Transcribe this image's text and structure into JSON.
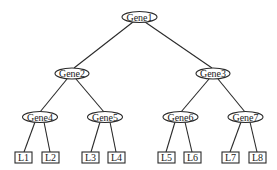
{
  "diagram": {
    "type": "binary-tree",
    "nodes": [
      {
        "id": "gene1",
        "label": "Gene1",
        "shape": "ellipse",
        "cx": 139.5,
        "cy": 17
      },
      {
        "id": "gene2",
        "label": "Gene2",
        "shape": "ellipse",
        "cx": 72,
        "cy": 73.5
      },
      {
        "id": "gene3",
        "label": "Gene3",
        "shape": "ellipse",
        "cx": 213,
        "cy": 73.5
      },
      {
        "id": "gene4",
        "label": "Gene4",
        "shape": "ellipse",
        "cx": 40,
        "cy": 117
      },
      {
        "id": "gene5",
        "label": "Gene5",
        "shape": "ellipse",
        "cx": 105,
        "cy": 117
      },
      {
        "id": "gene6",
        "label": "Gene6",
        "shape": "ellipse",
        "cx": 180.5,
        "cy": 117
      },
      {
        "id": "gene7",
        "label": "Gene7",
        "shape": "ellipse",
        "cx": 245.5,
        "cy": 117
      }
    ],
    "leaves": [
      {
        "id": "l1",
        "label": "L1",
        "shape": "rect",
        "x": 15,
        "y": 152
      },
      {
        "id": "l2",
        "label": "L2",
        "shape": "rect",
        "x": 42,
        "y": 152
      },
      {
        "id": "l3",
        "label": "L3",
        "shape": "rect",
        "x": 82,
        "y": 152
      },
      {
        "id": "l4",
        "label": "L4",
        "shape": "rect",
        "x": 108,
        "y": 152
      },
      {
        "id": "l5",
        "label": "L5",
        "shape": "rect",
        "x": 158,
        "y": 152
      },
      {
        "id": "l6",
        "label": "L6",
        "shape": "rect",
        "x": 184,
        "y": 152
      },
      {
        "id": "l7",
        "label": "L7",
        "shape": "rect",
        "x": 222,
        "y": 152
      },
      {
        "id": "l8",
        "label": "L8",
        "shape": "rect",
        "x": 249,
        "y": 152
      }
    ],
    "edges": [
      {
        "from": "Gene1",
        "to": "Gene2"
      },
      {
        "from": "Gene1",
        "to": "Gene3"
      },
      {
        "from": "Gene2",
        "to": "Gene4"
      },
      {
        "from": "Gene2",
        "to": "Gene5"
      },
      {
        "from": "Gene3",
        "to": "Gene6"
      },
      {
        "from": "Gene3",
        "to": "Gene7"
      },
      {
        "from": "Gene4",
        "to": "L1"
      },
      {
        "from": "Gene4",
        "to": "L2"
      },
      {
        "from": "Gene5",
        "to": "L3"
      },
      {
        "from": "Gene5",
        "to": "L4"
      },
      {
        "from": "Gene6",
        "to": "L5"
      },
      {
        "from": "Gene6",
        "to": "L6"
      },
      {
        "from": "Gene7",
        "to": "L7"
      },
      {
        "from": "Gene7",
        "to": "L8"
      }
    ],
    "colors": {
      "stroke": "#2a2a2a",
      "fill": "#ffffff",
      "text": "#1a1a1a"
    }
  }
}
